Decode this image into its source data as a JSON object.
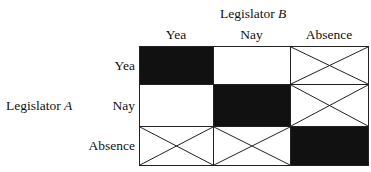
{
  "title_top": {
    "text": "Legislator",
    "var": "B"
  },
  "title_left": {
    "text": "Legislator",
    "var": "A"
  },
  "columns": [
    "Yea",
    "Nay",
    "Absence"
  ],
  "rows": [
    "Yea",
    "Nay",
    "Absence"
  ],
  "cells": [
    [
      "filled",
      "empty",
      "crossed"
    ],
    [
      "empty",
      "filled",
      "crossed"
    ],
    [
      "crossed",
      "crossed",
      "filled"
    ]
  ],
  "colors": {
    "filled": "#111111",
    "empty": "#ffffff",
    "line": "#222222"
  }
}
